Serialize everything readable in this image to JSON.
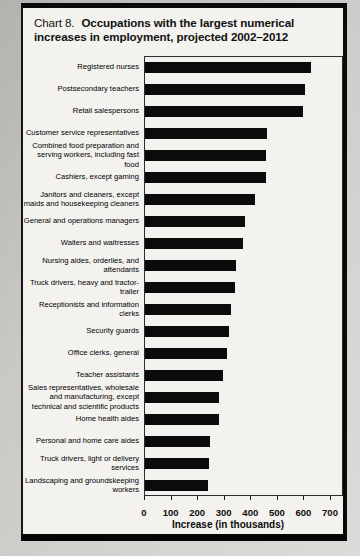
{
  "title": {
    "prefix": "Chart 8.",
    "main": "Occupations with the largest numerical increases in employment, projected 2002–2012"
  },
  "chart_data": {
    "type": "bar",
    "orientation": "horizontal",
    "categories": [
      "Registered nurses",
      "Postsecondary teachers",
      "Retail salespersons",
      "Customer service representatives",
      "Combined food preparation and serving workers, including fast food",
      "Cashiers, except gaming",
      "Janitors and cleaners, except maids and housekeeping cleaners",
      "General and operations managers",
      "Waiters and waitresses",
      "Nursing aides, orderlies, and attendants",
      "Truck drivers, heavy and tractor-trailer",
      "Receptionists and information clerks",
      "Security guards",
      "Office clerks, general",
      "Teacher assistants",
      "Sales representatives, wholesale and manufacturing, except technical and scientific products",
      "Home health aides",
      "Personal and home care aides",
      "Truck drivers, light or delivery services",
      "Landscaping and groundskeeping workers"
    ],
    "values": [
      623,
      603,
      596,
      460,
      454,
      454,
      414,
      376,
      367,
      343,
      337,
      325,
      317,
      310,
      294,
      279,
      279,
      246,
      242,
      237
    ],
    "xlabel": "Increase (in thousands)",
    "xlim": [
      0,
      700
    ],
    "xticks": [
      0,
      100,
      200,
      300,
      400,
      500,
      600,
      700
    ],
    "bar_color": "#0b0b0b",
    "grid": false,
    "legend": false
  }
}
